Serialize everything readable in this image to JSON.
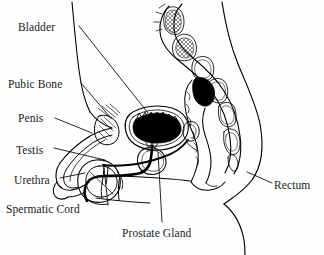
{
  "figure": {
    "background_color": "#fefefe",
    "line_color": "#000000",
    "width": 324,
    "height": 255
  },
  "labels": [
    {
      "id": "bladder",
      "text": "Bladder",
      "x": 18,
      "y": 22,
      "anchor": "left"
    },
    {
      "id": "pubic-bone",
      "text": "Pubic Bone",
      "x": 8,
      "y": 79,
      "anchor": "left"
    },
    {
      "id": "penis",
      "text": "Penis",
      "x": 18,
      "y": 113,
      "anchor": "left"
    },
    {
      "id": "testis",
      "text": "Testis",
      "x": 16,
      "y": 145,
      "anchor": "left"
    },
    {
      "id": "urethra",
      "text": "Urethra",
      "x": 14,
      "y": 175,
      "anchor": "left"
    },
    {
      "id": "spermatic-cord",
      "text": "Spermatic Cord",
      "x": 6,
      "y": 204,
      "anchor": "left"
    },
    {
      "id": "prostate-gland",
      "text": "Prostate Gland",
      "x": 122,
      "y": 228,
      "anchor": "left"
    },
    {
      "id": "rectum",
      "text": "Rectum",
      "x": 274,
      "y": 180,
      "anchor": "left"
    }
  ],
  "leader_lines": [
    {
      "id": "bladder-leader",
      "points": "79,26 148,113"
    },
    {
      "id": "pubic-bone-leader",
      "points": "81,83 110,117"
    },
    {
      "id": "penis-leader",
      "points": "55,118 92,133"
    },
    {
      "id": "testis-leader",
      "points": "54,148 105,160"
    },
    {
      "id": "urethra-leader",
      "points": "60,178 85,173"
    },
    {
      "id": "spermatic-cord-leader",
      "points": "108,205 104,168"
    },
    {
      "id": "prostate-gland-leader",
      "points": "162,222 158,152"
    },
    {
      "id": "rectum-leader",
      "points": "272,183 247,172"
    }
  ]
}
